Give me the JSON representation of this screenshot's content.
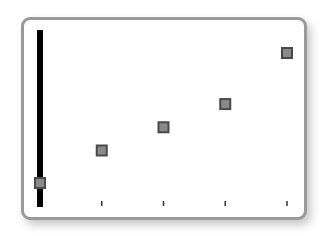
{
  "chart_data": {
    "type": "scatter",
    "title": "",
    "xlabel": "",
    "ylabel": "",
    "x": [
      0,
      1,
      2,
      3,
      4
    ],
    "series": [
      {
        "name": "points",
        "values": [
          1,
          2.4,
          3.4,
          4.4,
          6.6
        ],
        "marker": "square",
        "color": "#6b6b6b"
      }
    ],
    "xlim": [
      0,
      4
    ],
    "ylim": [
      0,
      7.5
    ],
    "grid": false,
    "legend": "none",
    "x_ticks_visible": [
      1,
      2,
      3,
      4
    ],
    "tick_labels": []
  },
  "style": {
    "frame_border": "#9a9a9a",
    "axis_color": "#000000",
    "marker_fill": "#8a8a8a",
    "marker_stroke": "#4a4a4a"
  }
}
